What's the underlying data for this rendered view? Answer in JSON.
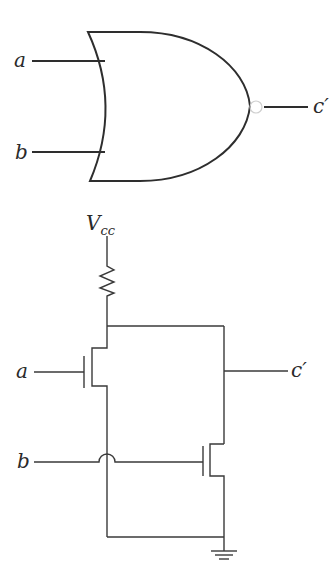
{
  "gate_diagram": {
    "type": "NOR gate",
    "inputs": [
      {
        "label": "a"
      },
      {
        "label": "b"
      }
    ],
    "output": {
      "label": "c′"
    }
  },
  "transistor_circuit": {
    "supply": {
      "label": "V",
      "subscript": "cc"
    },
    "inputs": [
      {
        "label": "a"
      },
      {
        "label": "b"
      }
    ],
    "output": {
      "label": "c′"
    },
    "components": [
      "pull-up resistor",
      "transistor (input a)",
      "transistor (input b)",
      "ground"
    ]
  },
  "colors": {
    "line": "#3a3a3a",
    "background": "#ffffff"
  }
}
